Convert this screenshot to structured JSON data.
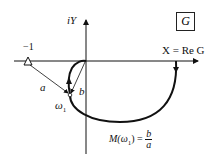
{
  "diagram": {
    "box_label": "G",
    "y_axis_label": "iY",
    "x_axis_label": "X = Re G",
    "critical_point_label": "−1",
    "vector_a_label": "a",
    "vector_b_label": "b",
    "omega_label": "ω",
    "omega_sub": "1",
    "magnitude_formula": {
      "lhs": "M(ω",
      "lhs_sub": "1",
      "lhs_close": ") =",
      "numerator": "b",
      "denominator": "a"
    },
    "colors": {
      "ink": "#111111",
      "background": "#ffffff"
    }
  }
}
